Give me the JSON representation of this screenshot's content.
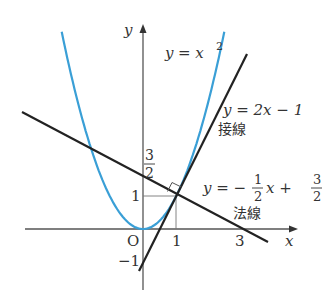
{
  "diagram": {
    "curves": {
      "parabola": {
        "equation": "y = x^2",
        "color": "#3a9fd6"
      },
      "tangent": {
        "equation": "y = 2x - 1",
        "label_jp": "接線",
        "color": "#222222"
      },
      "normal": {
        "equation": "y = -1/2 x + 3/2",
        "label_jp": "法線",
        "color": "#222222"
      }
    },
    "labels": {
      "y_axis": "y",
      "x_axis": "x",
      "origin": "O",
      "parabola_y": "y",
      "parabola_eq": "= x",
      "parabola_exp": "2",
      "tangent_eq": "y = 2x − 1",
      "tangent_jp": "接線",
      "normal_y": "y = −",
      "normal_num1": "1",
      "normal_den1": "2",
      "normal_mid": "x +",
      "normal_num2": "3",
      "normal_den2": "2",
      "normal_jp": "法線",
      "tick_x1": "1",
      "tick_x3": "3",
      "tick_y1": "1",
      "tick_ym1": "−1",
      "tick_y_num": "3",
      "tick_y_den": "2"
    },
    "point_of_tangency": [
      1,
      1
    ]
  }
}
